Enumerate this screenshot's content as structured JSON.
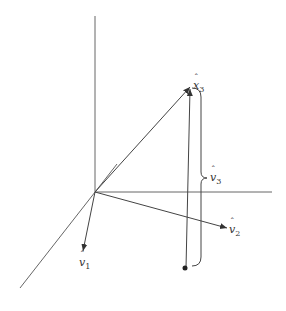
{
  "diagram": {
    "type": "3d-vector-projection",
    "origin": [
      95,
      192
    ],
    "axes": [
      {
        "name": "vertical-axis",
        "from": [
          95,
          192
        ],
        "to": [
          95,
          16
        ]
      },
      {
        "name": "horizontal-axis",
        "from": [
          95,
          192
        ],
        "to": [
          272,
          192
        ]
      },
      {
        "name": "depth-axis",
        "from": [
          95,
          192
        ],
        "to": [
          20,
          288
        ]
      },
      {
        "name": "depth-axis-back",
        "from": [
          95,
          192
        ],
        "to": [
          117,
          164
        ]
      }
    ],
    "vectors": [
      {
        "name": "x3",
        "label_var": "x",
        "label_sub": "3",
        "from": [
          95,
          192
        ],
        "to": [
          190,
          87
        ]
      },
      {
        "name": "v1",
        "label_var": "v",
        "label_sub": "1",
        "from": [
          95,
          192
        ],
        "to": [
          83,
          250
        ]
      },
      {
        "name": "v2",
        "label_var": "v",
        "label_sub": "2",
        "from": [
          95,
          192
        ],
        "to": [
          226,
          228
        ]
      },
      {
        "name": "projection",
        "from": [
          186,
          268
        ],
        "to": [
          190,
          88
        ]
      }
    ],
    "brace": {
      "label_var": "v",
      "label_sub": "3",
      "top": [
        198,
        88
      ],
      "bottom": [
        198,
        265
      ]
    },
    "point": [
      185,
      268
    ]
  },
  "labels": {
    "x3": {
      "var": "x",
      "sub": "3"
    },
    "v3": {
      "var": "v",
      "sub": "3"
    },
    "v2": {
      "var": "v",
      "sub": "2"
    },
    "v1": {
      "var": "v",
      "sub": "1"
    }
  }
}
